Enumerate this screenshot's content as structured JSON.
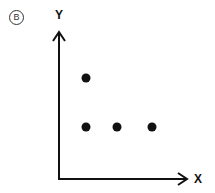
{
  "panel_label": "B",
  "chart_data": {
    "type": "scatter",
    "title": "",
    "xlabel": "X",
    "ylabel": "Y",
    "grid": false,
    "legend": null,
    "ticks": false,
    "points": [
      {
        "x": 1,
        "y": 2
      },
      {
        "x": 1,
        "y": 1
      },
      {
        "x": 2,
        "y": 1
      },
      {
        "x": 3,
        "y": 1
      }
    ],
    "pixel_points": [
      {
        "px": 86,
        "py": 78
      },
      {
        "px": 86,
        "py": 127
      },
      {
        "px": 117,
        "py": 127
      },
      {
        "px": 152,
        "py": 127
      }
    ],
    "colors": {
      "axis": "#111111",
      "points": "#111111"
    }
  }
}
